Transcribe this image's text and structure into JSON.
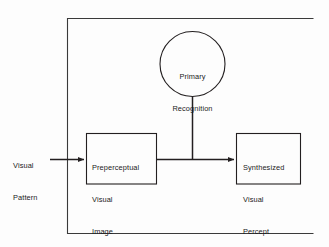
{
  "figure": {
    "type": "block-flow-diagram",
    "background_color": "#fdfdfd",
    "line_color": "#231f20",
    "text_color": "#1b1b1b"
  },
  "frame": {
    "name": "system-boundary",
    "visible_edges": "left, top, bottom (right edge cropped off image)"
  },
  "input": {
    "label_line1": "Visual",
    "label_line2": "Pattern"
  },
  "nodes": {
    "circle": {
      "label_line1": "Primary",
      "label_line2": "Recognition"
    },
    "left_box": {
      "label_line1": "Preperceptual",
      "label_line2": "Visual",
      "label_line3": "Image"
    },
    "right_box": {
      "label_line1": "Synthesized",
      "label_line2": "Visual",
      "label_line3": "Percept"
    }
  },
  "connectors": {
    "input_arrow": "Visual Pattern → Preperceptual Visual Image",
    "main_arrow": "Preperceptual Visual Image → Synthesized Visual Percept",
    "recognition_link": "Primary Recognition → main arrow junction"
  }
}
